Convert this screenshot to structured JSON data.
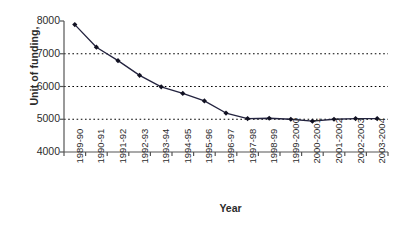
{
  "chart_data": {
    "type": "line",
    "title": "",
    "xlabel": "Year",
    "ylabel": "Unit of funding,",
    "categories": [
      "1989-90",
      "1990-91",
      "1991-92",
      "1992-93",
      "1993-94",
      "1994-95",
      "1995-96",
      "1996-97",
      "1997-98",
      "1998-99",
      "1999-2000",
      "2000-2001",
      "2001-2002",
      "2002-2003",
      "2003-2004"
    ],
    "values": [
      7890,
      7200,
      6790,
      6340,
      5990,
      5790,
      5560,
      5190,
      5020,
      5030,
      5000,
      4940,
      5000,
      5020,
      5020
    ],
    "series": [
      {
        "name": "Unit of funding",
        "values": [
          7890,
          7200,
          6790,
          6340,
          5990,
          5790,
          5560,
          5190,
          5020,
          5030,
          5000,
          4940,
          5000,
          5020,
          5020
        ]
      }
    ],
    "ylim": [
      4000,
      8000
    ],
    "yticks": [
      4000,
      5000,
      6000,
      7000,
      8000
    ],
    "ytick_labels": [
      "4000",
      "5000",
      "6000",
      "7000",
      "8000"
    ],
    "grid": "horizontal-dotted",
    "gridlines_at": [
      5000,
      6000,
      7000
    ],
    "legend": "none",
    "marker": "diamond",
    "line_color": "#1f1f3d",
    "marker_color": "#111122",
    "grid_color": "#000000",
    "axis_color": "#555555",
    "background": "#ffffff"
  },
  "axes": {
    "y_title": "Unit of funding,",
    "x_title": "Year",
    "y_tick_labels": [
      "8000",
      "7000",
      "6000",
      "5000",
      "4000"
    ],
    "x_tick_labels": [
      "1989-90",
      "1990-91",
      "1991-92",
      "1992-93",
      "1993-94",
      "1994-95",
      "1995-96",
      "1996-97",
      "1997-98",
      "1998-99",
      "1999-2000",
      "2000-2001",
      "2001-2002",
      "2002-2003",
      "2003-2004"
    ]
  }
}
